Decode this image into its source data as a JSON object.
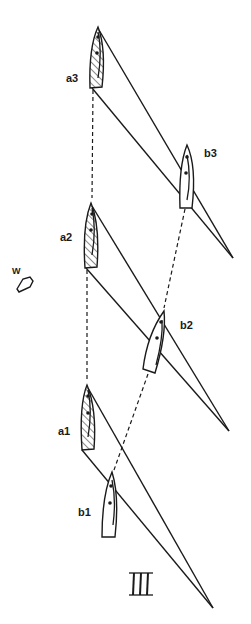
{
  "figure": {
    "panel_label": "III",
    "wind_label": "W",
    "colors": {
      "ink": "#1a1a1a",
      "background": "#ffffff"
    }
  },
  "boats": [
    {
      "id": "a3",
      "label": "a3",
      "hatched": true
    },
    {
      "id": "b3",
      "label": "b3",
      "hatched": false
    },
    {
      "id": "a2",
      "label": "a2",
      "hatched": true
    },
    {
      "id": "b2",
      "label": "b2",
      "hatched": false
    },
    {
      "id": "a1",
      "label": "a1",
      "hatched": true
    },
    {
      "id": "b1",
      "label": "b1",
      "hatched": false
    }
  ],
  "icons": {
    "wind": "wind-arrow-icon"
  }
}
